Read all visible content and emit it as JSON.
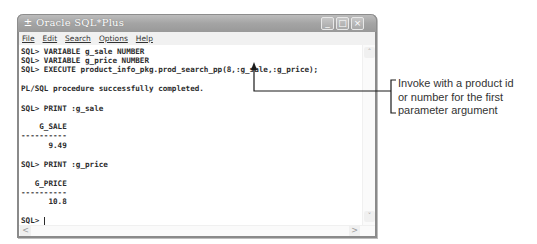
{
  "window": {
    "title": "Oracle SQL*Plus",
    "controls": {
      "minimize": "_",
      "maximize": "□",
      "close": "×"
    }
  },
  "menu": {
    "items": [
      {
        "label": "File",
        "underline": "F"
      },
      {
        "label": "Edit",
        "underline": "E"
      },
      {
        "label": "Search",
        "underline": "S"
      },
      {
        "label": "Options",
        "underline": "O"
      },
      {
        "label": "Help",
        "underline": "H"
      }
    ]
  },
  "console": {
    "lines": [
      "SQL> VARIABLE g_sale NUMBER",
      "SQL> VARIABLE g_price NUMBER",
      "SQL> EXECUTE product_info_pkg.prod_search_pp(8,:g_sale,:g_price);",
      "PL/SQL procedure successfully completed.",
      "SQL> PRINT :g_sale",
      "    G_SALE",
      "----------",
      "      9.49",
      "SQL> PRINT :g_price",
      "   G_PRICE",
      "----------",
      "      10.8",
      "SQL> "
    ]
  },
  "scrollbars": {
    "up": "˄",
    "down": "˅",
    "left": "<",
    "right": ">"
  },
  "callout": {
    "lines": [
      "Invoke with a product id",
      "or number for the first",
      "parameter argument"
    ]
  }
}
